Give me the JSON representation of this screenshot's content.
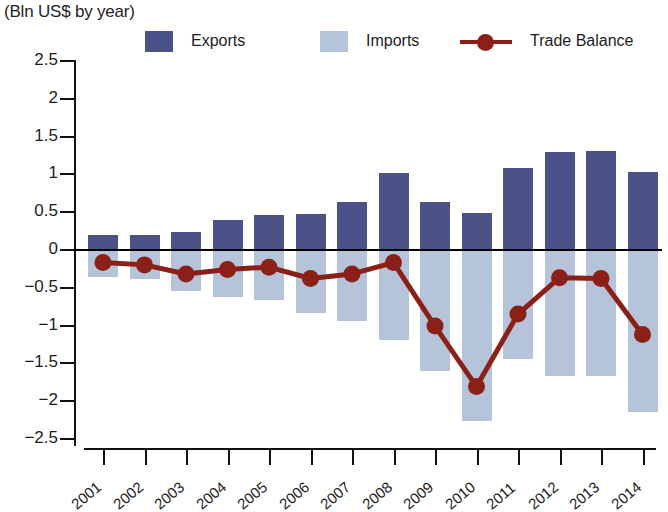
{
  "subtitle": "(Bln US$ by year)",
  "legend": [
    {
      "label": "Exports",
      "marker": "square",
      "color": "#4a5288",
      "name": "legend-exports"
    },
    {
      "label": "Imports",
      "marker": "square",
      "color": "#b6c4da",
      "name": "legend-imports"
    },
    {
      "label": "Trade Balance",
      "marker": "line-dot",
      "color": "#8b2018",
      "name": "legend-trade-balance"
    }
  ],
  "colors": {
    "exports": "#4a5288",
    "imports": "#b6c4da",
    "trade_balance": "#8b2018",
    "axis": "#111111",
    "text": "#1d1d1d"
  },
  "chart_data": {
    "type": "bar",
    "title": "",
    "subtitle": "(Bln US$ by year)",
    "xlabel": "",
    "ylabel": "",
    "ylim": [
      -2.5,
      2.5
    ],
    "yticks": [
      "2.5",
      "2",
      "1.5",
      "1",
      "0.5",
      "0",
      "−0.5",
      "−1",
      "−1.5",
      "−2",
      "−2.5"
    ],
    "ytick_values": [
      2.5,
      2,
      1.5,
      1,
      0.5,
      0,
      -0.5,
      -1,
      -1.5,
      -2,
      -2.5
    ],
    "grid": false,
    "legend_position": "top",
    "categories": [
      "2001",
      "2002",
      "2003",
      "2004",
      "2005",
      "2006",
      "2007",
      "2008",
      "2009",
      "2010",
      "2011",
      "2012",
      "2013",
      "2014"
    ],
    "series": [
      {
        "name": "Exports",
        "type": "bar",
        "color": "#4a5288",
        "values": [
          0.19,
          0.19,
          0.22,
          0.38,
          0.45,
          0.46,
          0.62,
          1.01,
          0.62,
          0.47,
          1.07,
          1.28,
          1.3,
          1.02
        ]
      },
      {
        "name": "Imports",
        "type": "bar",
        "color": "#b6c4da",
        "values": [
          -0.37,
          -0.4,
          -0.55,
          -0.64,
          -0.68,
          -0.85,
          -0.95,
          -1.2,
          -1.62,
          -2.28,
          -1.45,
          -1.68,
          -1.68,
          -2.15
        ]
      },
      {
        "name": "Trade Balance",
        "type": "line",
        "color": "#8b2018",
        "values": [
          -0.18,
          -0.21,
          -0.33,
          -0.27,
          -0.24,
          -0.39,
          -0.33,
          -0.18,
          -1.02,
          -1.82,
          -0.86,
          -0.38,
          -0.39,
          -1.13
        ]
      }
    ]
  }
}
